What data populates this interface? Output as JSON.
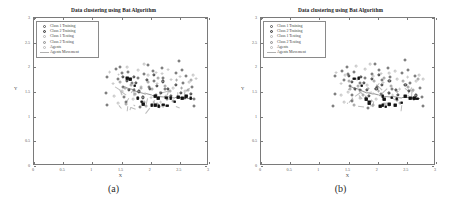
{
  "figure": {
    "background": "#ffffff",
    "panels": [
      {
        "caption": "(a)",
        "title": "Data clustering using Bat Algorithm",
        "xlabel": "X",
        "ylabel": "Y"
      },
      {
        "caption": "(b)",
        "title": "Data clustering using Bat Algorithm",
        "xlabel": "X",
        "ylabel": "Y"
      }
    ]
  },
  "axis": {
    "xticks": [
      "0",
      "0.5",
      "1",
      "1.5",
      "2",
      "2.5",
      "3"
    ],
    "yticks": [
      "0",
      "0.5",
      "1",
      "1.5",
      "2",
      "2.5",
      "3"
    ],
    "xlim": [
      0,
      3
    ],
    "ylim": [
      0,
      3
    ]
  },
  "legend": {
    "entries": [
      {
        "label": "Class 1 Training",
        "marker": "open-circle-dark",
        "color": "#555555"
      },
      {
        "label": "Class 2 Training",
        "marker": "filled-circle-gray",
        "color": "#333333"
      },
      {
        "label": "Class 1 Testing",
        "marker": "open-circle-light",
        "color": "#b2b2b2"
      },
      {
        "label": "Class 2 Testing",
        "marker": "open-circle-mid",
        "color": "#8f8f8f"
      },
      {
        "label": "Agents",
        "marker": "open-circle-faint",
        "color": "#b8b8b8"
      },
      {
        "label": "Agents Movement",
        "marker": "line",
        "color": "#b0b0b0"
      }
    ]
  },
  "chart_data": {
    "type": "scatter",
    "title": "Data clustering using Bat Algorithm",
    "xlabel": "X",
    "ylabel": "Y",
    "xlim": [
      0,
      3
    ],
    "ylim": [
      0,
      3
    ],
    "grid": false,
    "legend_position": "upper-left",
    "series": [
      {
        "name": "Class 1 Training",
        "marker": "circle-open",
        "color": "#555555",
        "points": [
          [
            1.25,
            1.8
          ],
          [
            1.25,
            1.48
          ],
          [
            1.25,
            1.22
          ],
          [
            1.4,
            1.95
          ],
          [
            1.42,
            1.75
          ],
          [
            1.48,
            2.02
          ],
          [
            1.5,
            1.88
          ],
          [
            1.52,
            1.62
          ],
          [
            1.55,
            1.42
          ],
          [
            1.58,
            1.3
          ],
          [
            1.62,
            1.9
          ],
          [
            1.68,
            1.7
          ],
          [
            1.72,
            1.52
          ],
          [
            1.78,
            1.78
          ],
          [
            1.8,
            1.38
          ],
          [
            1.82,
            1.2
          ],
          [
            1.88,
            1.85
          ],
          [
            1.95,
            2.05
          ],
          [
            1.98,
            1.6
          ],
          [
            2.02,
            1.92
          ],
          [
            2.05,
            1.72
          ],
          [
            2.08,
            1.45
          ],
          [
            2.18,
            1.98
          ],
          [
            2.22,
            1.8
          ],
          [
            2.25,
            1.55
          ],
          [
            2.3,
            1.35
          ],
          [
            2.42,
            1.88
          ],
          [
            2.48,
            2.12
          ],
          [
            2.52,
            1.95
          ],
          [
            2.55,
            1.68
          ],
          [
            2.62,
            1.82
          ],
          [
            2.7,
            1.6
          ],
          [
            2.75,
            1.38
          ],
          [
            2.75,
            1.22
          ]
        ]
      },
      {
        "name": "Class 2 Training",
        "marker": "circle-filled-gray",
        "color": "#333333",
        "points": [
          [
            1.52,
            1.8
          ],
          [
            1.58,
            1.72
          ],
          [
            1.62,
            1.55
          ],
          [
            1.7,
            1.82
          ],
          [
            1.75,
            1.68
          ],
          [
            1.8,
            1.52
          ],
          [
            1.85,
            1.4
          ],
          [
            1.92,
            1.75
          ],
          [
            1.98,
            1.58
          ],
          [
            2.05,
            1.85
          ],
          [
            2.1,
            1.62
          ],
          [
            2.18,
            1.48
          ],
          [
            2.22,
            1.7
          ],
          [
            2.28,
            1.55
          ],
          [
            2.35,
            1.42
          ],
          [
            2.45,
            1.65
          ],
          [
            2.52,
            1.5
          ],
          [
            2.6,
            1.38
          ],
          [
            2.68,
            1.45
          ]
        ]
      },
      {
        "name": "Class 1 Testing",
        "marker": "circle-open-light",
        "color": "#b2b2b2",
        "points": [
          [
            1.3,
            1.92
          ],
          [
            1.35,
            1.68
          ],
          [
            1.45,
            1.85
          ],
          [
            1.5,
            1.5
          ],
          [
            1.6,
            2.0
          ],
          [
            1.65,
            1.78
          ],
          [
            1.7,
            1.35
          ],
          [
            1.78,
            1.95
          ],
          [
            1.85,
            1.62
          ],
          [
            1.9,
            1.48
          ],
          [
            1.95,
            1.82
          ],
          [
            2.0,
            1.38
          ],
          [
            2.08,
            1.9
          ],
          [
            2.12,
            1.68
          ],
          [
            2.2,
            1.88
          ],
          [
            2.26,
            1.42
          ],
          [
            2.34,
            1.75
          ],
          [
            2.4,
            1.58
          ],
          [
            2.5,
            1.8
          ],
          [
            2.58,
            1.52
          ],
          [
            2.65,
            1.7
          ],
          [
            2.72,
            1.85
          ],
          [
            2.78,
            1.78
          ],
          [
            1.38,
            1.42
          ],
          [
            1.44,
            1.28
          ],
          [
            2.16,
            1.28
          ],
          [
            2.3,
            1.95
          ],
          [
            1.88,
            2.08
          ]
        ]
      },
      {
        "name": "Class 2 Testing",
        "marker": "circle-open-mid",
        "color": "#8f8f8f",
        "points": [
          [
            1.48,
            1.7
          ],
          [
            1.55,
            1.58
          ],
          [
            1.66,
            1.62
          ],
          [
            1.74,
            1.45
          ],
          [
            1.82,
            1.58
          ],
          [
            1.9,
            1.3
          ],
          [
            1.96,
            1.7
          ],
          [
            2.04,
            1.55
          ],
          [
            2.14,
            1.8
          ],
          [
            2.24,
            1.62
          ],
          [
            2.32,
            1.5
          ],
          [
            2.44,
            1.72
          ],
          [
            2.54,
            1.6
          ],
          [
            2.64,
            1.55
          ],
          [
            2.7,
            1.75
          ],
          [
            1.58,
            1.25
          ],
          [
            1.92,
            1.22
          ],
          [
            2.1,
            1.25
          ],
          [
            2.38,
            1.3
          ],
          [
            2.2,
            1.22
          ]
        ]
      },
      {
        "name": "Agents",
        "marker": "square-filled",
        "color": "#1a1a1a",
        "points": [
          [
            1.58,
            1.78
          ],
          [
            1.72,
            1.62
          ],
          [
            1.78,
            1.38
          ],
          [
            1.84,
            1.3
          ],
          [
            2.02,
            1.22
          ],
          [
            2.06,
            1.24
          ],
          [
            2.12,
            1.38
          ],
          [
            2.14,
            1.22
          ],
          [
            2.2,
            1.24
          ],
          [
            2.26,
            1.4
          ],
          [
            2.3,
            1.22
          ],
          [
            2.34,
            1.38
          ],
          [
            2.42,
            1.3
          ],
          [
            2.48,
            1.4
          ],
          [
            2.56,
            1.38
          ],
          [
            2.62,
            1.4
          ],
          [
            2.7,
            1.38
          ],
          [
            1.66,
            1.76
          ],
          [
            2.08,
            1.4
          ],
          [
            1.88,
            1.24
          ]
        ]
      }
    ],
    "agents_movement": {
      "name": "Agents Movement",
      "color": "#9a9a9a",
      "path": [
        [
          1.52,
          1.62
        ],
        [
          1.62,
          1.58
        ],
        [
          1.72,
          1.55
        ],
        [
          1.82,
          1.5
        ],
        [
          1.92,
          1.47
        ],
        [
          2.02,
          1.44
        ],
        [
          2.12,
          1.42
        ],
        [
          2.22,
          1.41
        ],
        [
          2.32,
          1.4
        ],
        [
          2.42,
          1.39
        ],
        [
          2.52,
          1.39
        ],
        [
          2.62,
          1.38
        ],
        [
          2.72,
          1.38
        ]
      ]
    }
  }
}
